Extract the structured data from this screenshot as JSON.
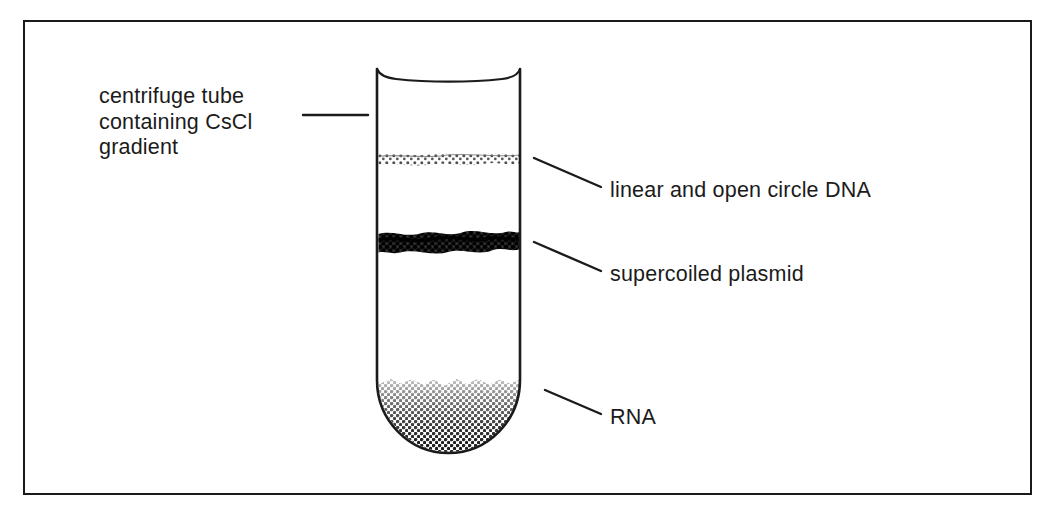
{
  "figure": {
    "type": "diagram",
    "border_color": "#1a1a1a",
    "background_color": "#ffffff",
    "ink_color": "#1b1b1b"
  },
  "labels": {
    "tube": {
      "line1": "centrifuge tube",
      "line2": "containing CsCl",
      "line3": "gradient"
    },
    "dna_band": "linear and open circle DNA",
    "supercoiled_band": "supercoiled plasmid",
    "rna_band": "RNA"
  },
  "tube": {
    "name": "centrifuge-tube",
    "left_x": 377,
    "right_x": 520,
    "top_y": 68,
    "bottom_y": 450,
    "wall_color": "#1b1b1b",
    "fill_color": "#ffffff"
  },
  "bands": [
    {
      "id": "linear-open-circle-dna",
      "label": "linear and open circle DNA",
      "top_y": 153,
      "bottom_y": 163,
      "density": "light",
      "texture": "fine stipple",
      "color": "#4a4a4a"
    },
    {
      "id": "supercoiled-plasmid",
      "label": "supercoiled plasmid",
      "top_y": 231,
      "bottom_y": 252,
      "density": "heavy",
      "texture": "dense coarse stipple",
      "color": "#141414"
    },
    {
      "id": "rna-pellet",
      "label": "RNA",
      "top_y": 378,
      "bottom_y": 450,
      "density": "gradient light-to-dark",
      "texture": "halftone dot gradient",
      "color": "#1f1f1f"
    }
  ],
  "leader_lines": [
    {
      "id": "leader-tube",
      "from_x": 303,
      "from_y": 115,
      "to_x": 368,
      "to_y": 115,
      "orientation": "horizontal"
    },
    {
      "id": "leader-dna",
      "from_x": 534,
      "from_y": 158,
      "to_x": 601,
      "to_y": 187,
      "orientation": "diagonal"
    },
    {
      "id": "leader-supercoiled",
      "from_x": 534,
      "from_y": 242,
      "to_x": 601,
      "to_y": 271,
      "orientation": "diagonal"
    },
    {
      "id": "leader-rna",
      "from_x": 545,
      "from_y": 390,
      "to_x": 601,
      "to_y": 414,
      "orientation": "diagonal"
    }
  ]
}
